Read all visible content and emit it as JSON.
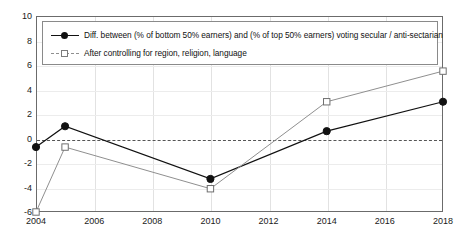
{
  "chart_data": {
    "type": "line",
    "title": "",
    "xlabel": "",
    "ylabel": "",
    "x": [
      2004,
      2005,
      2010,
      2014,
      2018
    ],
    "xticks": [
      "2004",
      "2006",
      "2008",
      "2010",
      "2012",
      "2014",
      "2016",
      "2018"
    ],
    "xtick_values": [
      2004,
      2006,
      2008,
      2010,
      2012,
      2014,
      2016,
      2018
    ],
    "yticks": [
      "10",
      "8",
      "6",
      "4",
      "2",
      "0",
      "-2",
      "-4",
      "-6"
    ],
    "ytick_values": [
      10,
      8,
      6,
      4,
      2,
      0,
      -2,
      -4,
      -6
    ],
    "xlim": [
      2004,
      2018
    ],
    "ylim": [
      -6,
      10
    ],
    "grid": true,
    "zero_reference_line": 0,
    "legend_position": "top-left",
    "series": [
      {
        "name": "Diff. between (% of bottom 50% earners) and (% of top 50% earners) voting secular / anti-sectarian",
        "marker": "filled-circle",
        "color": "#111111",
        "x": [
          2004,
          2005,
          2010,
          2014,
          2018
        ],
        "values": [
          -0.7,
          1.0,
          -3.3,
          0.6,
          3.0
        ]
      },
      {
        "name": "After controlling for region, religion, language",
        "marker": "hollow-square",
        "color": "#8f8f8f",
        "x": [
          2004,
          2005,
          2010,
          2014,
          2018
        ],
        "values": [
          -6.0,
          -0.7,
          -4.1,
          3.0,
          5.5
        ]
      }
    ]
  },
  "legend": {
    "items": [
      {
        "label": "Diff. between (% of bottom 50% earners) and (% of top 50% earners) voting secular / anti-sectarian"
      },
      {
        "label": "After controlling for region, religion, language"
      }
    ]
  },
  "colors": {
    "series_primary": "#111111",
    "series_secondary": "#8f8f8f",
    "frame": "#6b6b6b",
    "grid": "#e2e2e2",
    "zero_line": "#555555",
    "background": "#ffffff"
  }
}
